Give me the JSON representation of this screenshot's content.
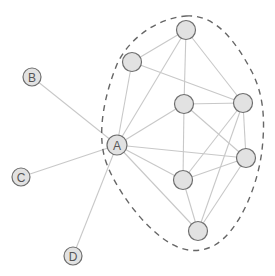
{
  "diagram": {
    "title": "",
    "colors": {
      "background": "#ffffff",
      "edge": "#c8c8c8",
      "node_fill": "#e2e2e2",
      "node_stroke": "#6e6e6e",
      "label": "#555555",
      "boundary": "#666666"
    },
    "nodes": [
      {
        "id": "A",
        "label": "A",
        "x": 117,
        "y": 145,
        "r": 10,
        "labeled": true
      },
      {
        "id": "B",
        "label": "B",
        "x": 32,
        "y": 77,
        "r": 9,
        "labeled": true
      },
      {
        "id": "C",
        "label": "C",
        "x": 21,
        "y": 177,
        "r": 9,
        "labeled": true
      },
      {
        "id": "D",
        "label": "D",
        "x": 73,
        "y": 256,
        "r": 9,
        "labeled": true
      },
      {
        "id": "n1",
        "label": "",
        "x": 186,
        "y": 30,
        "r": 9.5,
        "labeled": false
      },
      {
        "id": "n2",
        "label": "",
        "x": 132,
        "y": 62,
        "r": 9.5,
        "labeled": false
      },
      {
        "id": "n3",
        "label": "",
        "x": 184,
        "y": 104,
        "r": 9.5,
        "labeled": false
      },
      {
        "id": "n4",
        "label": "",
        "x": 243,
        "y": 103,
        "r": 9.5,
        "labeled": false
      },
      {
        "id": "n5",
        "label": "",
        "x": 246,
        "y": 158,
        "r": 9.5,
        "labeled": false
      },
      {
        "id": "n6",
        "label": "",
        "x": 183,
        "y": 180,
        "r": 9.5,
        "labeled": false
      },
      {
        "id": "n7",
        "label": "",
        "x": 198,
        "y": 231,
        "r": 9.5,
        "labeled": false
      }
    ],
    "edges": [
      [
        "A",
        "B"
      ],
      [
        "A",
        "C"
      ],
      [
        "A",
        "D"
      ],
      [
        "n1",
        "n2"
      ],
      [
        "n1",
        "A"
      ],
      [
        "n1",
        "n3"
      ],
      [
        "n1",
        "n4"
      ],
      [
        "n2",
        "A"
      ],
      [
        "n2",
        "n4"
      ],
      [
        "n3",
        "A"
      ],
      [
        "n3",
        "n4"
      ],
      [
        "n3",
        "n6"
      ],
      [
        "n3",
        "n5"
      ],
      [
        "A",
        "n5"
      ],
      [
        "A",
        "n6"
      ],
      [
        "A",
        "n7"
      ],
      [
        "n4",
        "n5"
      ],
      [
        "n4",
        "n6"
      ],
      [
        "n4",
        "n7"
      ],
      [
        "n5",
        "n6"
      ],
      [
        "n5",
        "n7"
      ],
      [
        "n6",
        "n7"
      ]
    ],
    "boundary": {
      "style": "dashed",
      "encloses": [
        "A",
        "n1",
        "n2",
        "n3",
        "n4",
        "n5",
        "n6",
        "n7"
      ],
      "path": "M 186 16 C 215 14, 235 40, 252 72 C 262 92, 266 115, 262 150 C 258 185, 240 230, 215 245 C 195 256, 175 250, 155 232 C 135 215, 110 180, 104 155 C 98 130, 104 95, 118 62 C 132 35, 160 18, 186 16 Z"
    }
  }
}
